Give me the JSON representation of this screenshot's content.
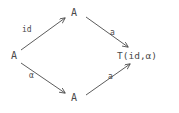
{
  "diagram": {
    "type": "commutative-square",
    "background_color": "#ffffff",
    "stroke_color": "#4a4a4a",
    "text_color": "#4a4a4a",
    "nodes": [
      {
        "id": "top",
        "label": "A",
        "x": 76,
        "y": 13
      },
      {
        "id": "left",
        "label": "A",
        "x": 15,
        "y": 56
      },
      {
        "id": "bottom",
        "label": "A",
        "x": 76,
        "y": 98
      },
      {
        "id": "target",
        "label": "T(id,α)",
        "x": 140,
        "y": 56
      }
    ],
    "edges": [
      {
        "id": "left-to-top",
        "label": "id",
        "from": "left",
        "to": "top",
        "arrowhead": "to"
      },
      {
        "id": "top-to-target",
        "label": "a",
        "from": "top",
        "to": "target",
        "arrowhead": "to"
      },
      {
        "id": "left-to-bottom",
        "label": "α",
        "from": "left",
        "to": "bottom",
        "arrowhead": "to"
      },
      {
        "id": "bottom-to-target",
        "label": "a",
        "from": "bottom",
        "to": "target",
        "arrowhead": "to"
      }
    ]
  }
}
